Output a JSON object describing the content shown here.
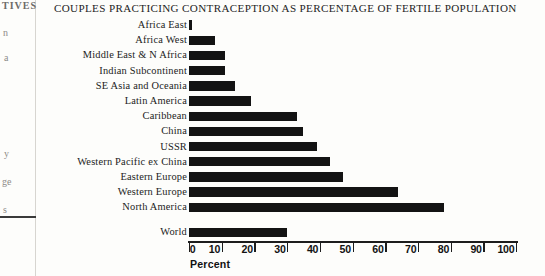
{
  "chart_data": {
    "type": "bar",
    "orientation": "horizontal",
    "title": "COUPLES PRACTICING CONTRACEPTION AS PERCENTAGE OF  FERTILE POPULATION",
    "xlabel": "Percent",
    "ylabel": "",
    "xlim": [
      0,
      100
    ],
    "grid": false,
    "legend": null,
    "xticks": [
      0,
      10,
      20,
      30,
      40,
      50,
      60,
      70,
      80,
      90,
      100
    ],
    "xtick_labels": [
      "0",
      "10",
      "20",
      "30",
      "40",
      "50",
      "60",
      "70",
      "80",
      "90",
      "100"
    ],
    "bar_color": "#131313",
    "categories": [
      "Africa East",
      "Africa West",
      "Middle East & N Africa",
      "Indian Subcontinent",
      "SE Asia and Oceania",
      "Latin America",
      "Caribbean",
      "China",
      "USSR",
      "Western Pacific ex China",
      "Eastern Europe",
      "Western Europe",
      "North America"
    ],
    "values": [
      1,
      8,
      11,
      11,
      14,
      19,
      33,
      35,
      39,
      43,
      47,
      64,
      78
    ],
    "summary_category": "World",
    "summary_value": 30
  },
  "page": {
    "bleed_fragments": [
      {
        "text": "TIVES",
        "x": 2,
        "y": 0,
        "size": 10,
        "bold": true
      },
      {
        "text": "n",
        "x": 3,
        "y": 27,
        "size": 10,
        "bold": false
      },
      {
        "text": "a",
        "x": 4,
        "y": 52,
        "size": 10,
        "bold": false
      },
      {
        "text": "y",
        "x": 4,
        "y": 148,
        "size": 10,
        "bold": false
      },
      {
        "text": "ge",
        "x": 2,
        "y": 176,
        "size": 10,
        "bold": false
      },
      {
        "text": "s",
        "x": 3,
        "y": 204,
        "size": 10,
        "bold": false
      }
    ]
  }
}
